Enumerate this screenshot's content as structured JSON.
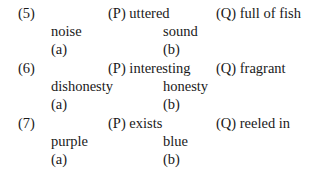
{
  "questions": [
    {
      "number": "(5)",
      "p": "(P) uttered",
      "q": "(Q) full of fish",
      "option_a_word": "noise",
      "option_b_word": "sound",
      "option_a_label": "(a)",
      "option_b_label": "(b)"
    },
    {
      "number": "(6)",
      "p": "(P) interesting",
      "q": "(Q) fragrant",
      "option_a_word": "dishonesty",
      "option_b_word": "honesty",
      "option_a_label": "(a)",
      "option_b_label": "(b)"
    },
    {
      "number": "(7)",
      "p": "(P) exists",
      "q": "(Q) reeled in",
      "option_a_word": "purple",
      "option_b_word": "blue",
      "option_a_label": "(a)",
      "option_b_label": "(b)"
    }
  ]
}
